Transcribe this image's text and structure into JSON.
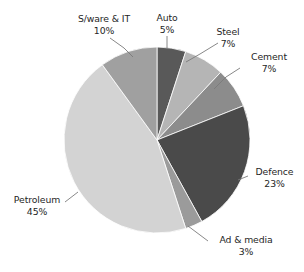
{
  "chart_data": {
    "type": "pie",
    "title": "",
    "subtitle": "",
    "xlabel": "",
    "ylabel": "",
    "legend_position": "none",
    "grid": false,
    "labels_outside": true,
    "value_suffix": "%",
    "start_angle_deg": 0,
    "direction": "clockwise",
    "categories": [
      "Auto",
      "Steel",
      "Cement",
      "Defence",
      "Ad & media",
      "Petroleum",
      "S/ware & IT"
    ],
    "values": [
      5,
      7,
      7,
      23,
      3,
      45,
      10
    ],
    "slices": [
      {
        "label": "Auto",
        "value": 5,
        "value_text": "5%",
        "color": "#595959"
      },
      {
        "label": "Steel",
        "value": 7,
        "value_text": "7%",
        "color": "#b5b5b5"
      },
      {
        "label": "Cement",
        "value": 7,
        "value_text": "7%",
        "color": "#8c8c8c"
      },
      {
        "label": "Defence",
        "value": 23,
        "value_text": "23%",
        "color": "#4a4a4a"
      },
      {
        "label": "Ad & media",
        "value": 3,
        "value_text": "3%",
        "color": "#9b9b9b"
      },
      {
        "label": "Petroleum",
        "value": 45,
        "value_text": "45%",
        "color": "#d3d3d3"
      },
      {
        "label": "S/ware & IT",
        "value": 10,
        "value_text": "10%",
        "color": "#a0a0a0"
      }
    ]
  },
  "labels": {
    "auto": {
      "name": "Auto",
      "pct": "5%"
    },
    "steel": {
      "name": "Steel",
      "pct": "7%"
    },
    "cement": {
      "name": "Cement",
      "pct": "7%"
    },
    "defence": {
      "name": "Defence",
      "pct": "23%"
    },
    "ad_media": {
      "name": "Ad & media",
      "pct": "3%"
    },
    "petroleum": {
      "name": "Petroleum",
      "pct": "45%"
    },
    "sware_it": {
      "name": "S/ware & IT",
      "pct": "10%"
    }
  },
  "colors": {
    "auto": "#595959",
    "steel": "#b5b5b5",
    "cement": "#8c8c8c",
    "defence": "#4a4a4a",
    "ad_media": "#9b9b9b",
    "petroleum": "#d3d3d3",
    "sware_it": "#a0a0a0",
    "background": "#ffffff",
    "text": "#262626",
    "leader_line": "#7a7a7a",
    "slice_border": "#ffffff"
  }
}
